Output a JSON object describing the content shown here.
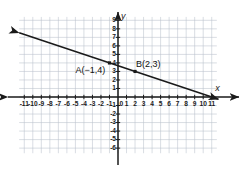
{
  "figure": {
    "kind": "coordinate-plane-line-graph",
    "background": "#ffffff",
    "grid_color": "#b9c0cc",
    "axis_color": "#1a1a1a",
    "line_color": "#1a1a1a"
  },
  "axes": {
    "x_axis_label": "x",
    "y_axis_label": "y",
    "origin_label": "0",
    "x_ticks": [
      "-11",
      "-10",
      "-9",
      "-8",
      "-7",
      "-6",
      "-5",
      "-4",
      "-3",
      "-2",
      "-1",
      "1",
      "2",
      "3",
      "4",
      "5",
      "6",
      "7",
      "8",
      "9",
      "10",
      "11"
    ],
    "y_ticks": [
      "9",
      "8",
      "7",
      "6",
      "5",
      "4",
      "3",
      "2",
      "1",
      "-1",
      "-2",
      "-3",
      "-4",
      "-5",
      "-6"
    ]
  },
  "annotations": {
    "point_a_label": "A(−1,4)",
    "point_b_label": "B(2,3)"
  },
  "chart_data": {
    "type": "line",
    "title": "",
    "xlabel": "x",
    "ylabel": "y",
    "xlim": [
      -11.5,
      11.8
    ],
    "ylim": [
      -6.5,
      9.5
    ],
    "grid": true,
    "grid_step": 1,
    "legend": "none",
    "series": [
      {
        "name": "line through A and B",
        "equation": "y = -x/3 + 11/3",
        "slope": -0.3333,
        "y_intercept": 3.6667,
        "x_intercept": 11,
        "arrows": "both",
        "endpoints": [
          [
            -11.6,
            7.53
          ],
          [
            11.8,
            -0.27
          ]
        ]
      }
    ],
    "points": [
      {
        "label": "A(−1,4)",
        "x": -1,
        "y": 4
      },
      {
        "label": "B(2,3)",
        "x": 2,
        "y": 3
      }
    ],
    "x_tick_values": [
      -11,
      -10,
      -9,
      -8,
      -7,
      -6,
      -5,
      -4,
      -3,
      -2,
      -1,
      1,
      2,
      3,
      4,
      5,
      6,
      7,
      8,
      9,
      10,
      11
    ],
    "y_tick_values": [
      9,
      8,
      7,
      6,
      5,
      4,
      3,
      2,
      1,
      -1,
      -2,
      -3,
      -4,
      -5,
      -6
    ]
  }
}
